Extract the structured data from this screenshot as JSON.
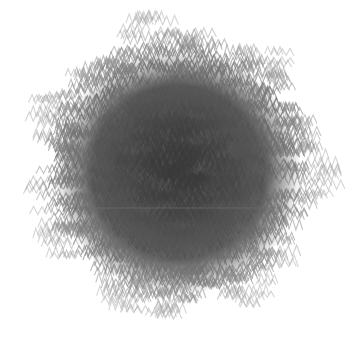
{
  "image": {
    "width": 354,
    "height": 347,
    "background": "#ffffff",
    "description": "Dense circular cloud of overlapping gray zig-zag chevron strokes"
  },
  "cloud": {
    "center_x": 178,
    "center_y": 172,
    "core_radius": 105,
    "outer_radius": 142,
    "core_color": "#4a4a4a",
    "fringe_color": "#8a8a8a",
    "core_fill_opacity": 0.95,
    "stroke_count": 1400,
    "stroke_width": 1.1,
    "zig_segments": 3,
    "zig_width": 7,
    "zig_height": 8,
    "seed": 1337
  },
  "artifacts": {
    "horizontal_line_y": 208,
    "horizontal_line_x1": 70,
    "horizontal_line_x2": 280,
    "horizontal_line_color": "#6e6e6e"
  }
}
